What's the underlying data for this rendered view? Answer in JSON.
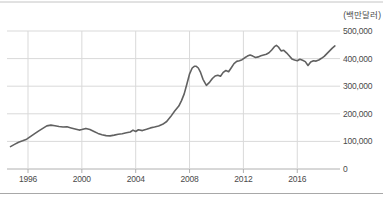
{
  "figure": {
    "unit_label": "(백만달러)"
  },
  "colors": {
    "background": "#ffffff",
    "grid": "#d9d9d9",
    "zero_axis": "#b0b0b0",
    "series_line": "#616161",
    "text": "#4a4a4a",
    "top_border": "#c4c4c4",
    "bottom_border": "#a8a8a8"
  },
  "chart_data": {
    "type": "line",
    "title": "",
    "unit_label": "(백만달러)",
    "xlabel": "",
    "ylabel": "(백만달러)",
    "grid": true,
    "legend": "none",
    "y_axis_side": "right",
    "xlim": [
      1994.5,
      2019.2
    ],
    "ylim": [
      0,
      500000
    ],
    "x_ticks": [
      1996,
      2000,
      2004,
      2008,
      2012,
      2016
    ],
    "x_tick_labels": [
      "1996",
      "2000",
      "2004",
      "2008",
      "2012",
      "2016"
    ],
    "y_ticks": [
      0,
      100000,
      200000,
      300000,
      400000,
      500000
    ],
    "y_tick_labels": [
      "0",
      "100,000",
      "200,000",
      "300,000",
      "400,000",
      "500,000"
    ],
    "line_color": "#616161",
    "x": [
      1994.7,
      1995.0,
      1995.3,
      1995.6,
      1995.9,
      1996.2,
      1996.5,
      1996.8,
      1997.1,
      1997.4,
      1997.7,
      1998.0,
      1998.3,
      1998.6,
      1998.9,
      1999.2,
      1999.5,
      1999.8,
      2000.0,
      2000.3,
      2000.6,
      2000.9,
      2001.2,
      2001.5,
      2001.8,
      2002.1,
      2002.4,
      2002.7,
      2003.0,
      2003.3,
      2003.6,
      2003.8,
      2004.0,
      2004.2,
      2004.5,
      2004.8,
      2005.1,
      2005.4,
      2005.7,
      2006.0,
      2006.3,
      2006.6,
      2006.9,
      2007.2,
      2007.4,
      2007.6,
      2007.8,
      2008.0,
      2008.2,
      2008.35,
      2008.5,
      2008.65,
      2008.8,
      2009.0,
      2009.25,
      2009.5,
      2009.7,
      2009.9,
      2010.1,
      2010.3,
      2010.5,
      2010.7,
      2010.9,
      2011.1,
      2011.3,
      2011.5,
      2011.7,
      2011.9,
      2012.1,
      2012.3,
      2012.5,
      2012.7,
      2012.9,
      2013.1,
      2013.3,
      2013.5,
      2013.7,
      2013.9,
      2014.1,
      2014.3,
      2014.45,
      2014.6,
      2014.8,
      2015.0,
      2015.2,
      2015.4,
      2015.6,
      2015.8,
      2016.0,
      2016.2,
      2016.4,
      2016.6,
      2016.8,
      2017.0,
      2017.2,
      2017.4,
      2017.6,
      2017.8,
      2018.0,
      2018.2,
      2018.4,
      2018.6,
      2018.8
    ],
    "values": [
      81000,
      89000,
      97000,
      102000,
      108000,
      118000,
      128000,
      138000,
      147000,
      156000,
      159000,
      157000,
      154000,
      152000,
      153000,
      149000,
      145000,
      141000,
      143000,
      147000,
      143000,
      136000,
      129000,
      124000,
      121000,
      120000,
      123000,
      126000,
      128000,
      131000,
      134000,
      141000,
      136000,
      142000,
      139000,
      144000,
      149000,
      152000,
      156000,
      162000,
      172000,
      190000,
      210000,
      228000,
      248000,
      272000,
      308000,
      345000,
      366000,
      372000,
      372000,
      366000,
      352000,
      325000,
      303000,
      315000,
      328000,
      337000,
      340000,
      336000,
      350000,
      357000,
      352000,
      367000,
      382000,
      390000,
      392000,
      396000,
      403000,
      409000,
      413000,
      409000,
      404000,
      406000,
      410000,
      413000,
      416000,
      421000,
      431000,
      443000,
      448000,
      442000,
      428000,
      430000,
      421000,
      410000,
      399000,
      395000,
      392000,
      398000,
      394000,
      389000,
      375000,
      388000,
      392000,
      391000,
      395000,
      401000,
      408000,
      418000,
      428000,
      438000,
      446000
    ]
  }
}
